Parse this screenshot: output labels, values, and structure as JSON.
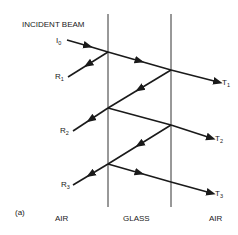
{
  "diagram": {
    "title": "INCIDENT BEAM",
    "panel_label": "(a)",
    "media": [
      {
        "name": "AIR",
        "x": 58
      },
      {
        "name": "GLASS",
        "x": 139
      },
      {
        "name": "AIR",
        "x": 211
      }
    ],
    "beams": {
      "incident": {
        "symbol": "I",
        "subscript": "0"
      },
      "reflected": [
        {
          "symbol": "R",
          "subscript": "1"
        },
        {
          "symbol": "R",
          "subscript": "2"
        },
        {
          "symbol": "R",
          "subscript": "3"
        }
      ],
      "transmitted": [
        {
          "symbol": "T",
          "subscript": "1"
        },
        {
          "symbol": "T",
          "subscript": "2"
        },
        {
          "symbol": "T",
          "subscript": "3"
        }
      ]
    },
    "colors": {
      "line": "#1a1a1a",
      "background": "#ffffff"
    }
  }
}
